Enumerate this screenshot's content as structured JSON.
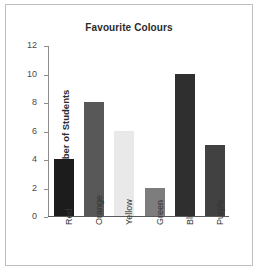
{
  "chart_data": {
    "type": "bar",
    "title": "Favourite Colours",
    "xlabel": "",
    "ylabel": "Number of Students",
    "categories": [
      "Red",
      "Orange",
      "Yellow",
      "Green",
      "Blue",
      "Purple"
    ],
    "values": [
      4,
      8,
      6,
      2,
      10,
      5
    ],
    "yticks": [
      0,
      2,
      4,
      6,
      8,
      10,
      12
    ],
    "ylim": [
      0,
      12
    ],
    "grid": false,
    "legend": false,
    "bar_colors": [
      "#1c1c1c",
      "#585858",
      "#e9e9e9",
      "#7d7d7d",
      "#2f2f2f",
      "#414141"
    ],
    "axis_color": "#8c8c8c",
    "frame_color": "#bfbfbf",
    "background": "#ffffff"
  }
}
